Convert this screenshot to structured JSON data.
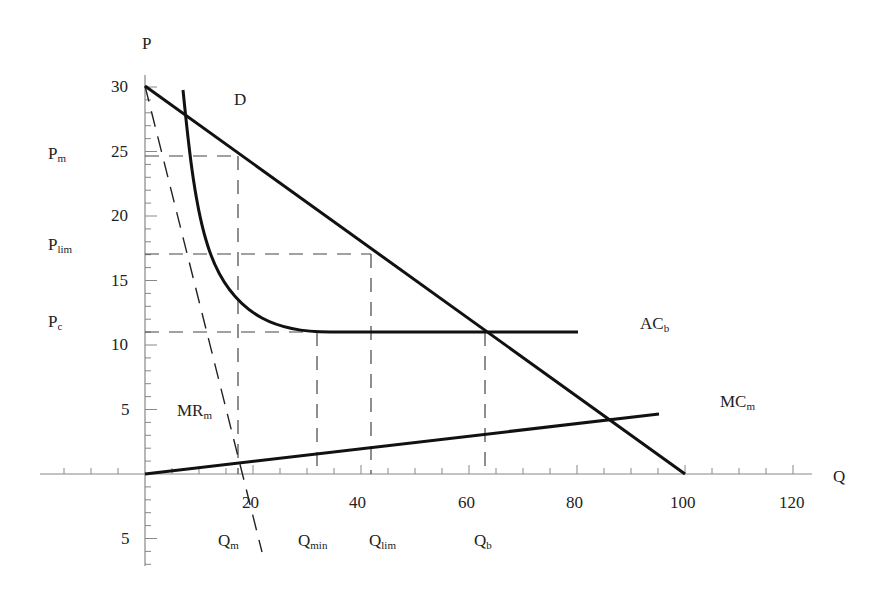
{
  "chart_data": {
    "type": "line",
    "title": "",
    "xlabel": "Q",
    "ylabel": "P",
    "xlim": [
      -19,
      123
    ],
    "ylim": [
      -7,
      31
    ],
    "grid": false,
    "x_ticks": [
      {
        "value": 20,
        "label": "20"
      },
      {
        "value": 40,
        "label": "40"
      },
      {
        "value": 60,
        "label": "60"
      },
      {
        "value": 80,
        "label": "80"
      },
      {
        "value": 100,
        "label": "100"
      },
      {
        "value": 120,
        "label": "120"
      }
    ],
    "y_ticks": [
      {
        "value": 30,
        "label": "30"
      },
      {
        "value": 25,
        "label": "25"
      },
      {
        "value": 20,
        "label": "20"
      },
      {
        "value": 15,
        "label": "15"
      },
      {
        "value": 10,
        "label": "10"
      },
      {
        "value": 5,
        "label": "5"
      },
      {
        "value": -5,
        "label": "5"
      }
    ],
    "series": [
      {
        "name": "D",
        "style": "solid",
        "points": [
          [
            0,
            30
          ],
          [
            100,
            0
          ]
        ]
      },
      {
        "name": "MR_m",
        "style": "dashed",
        "points": [
          [
            0,
            30
          ],
          [
            21.7,
            -6
          ]
        ]
      },
      {
        "name": "AC_b",
        "style": "solid",
        "points": [
          [
            7.0,
            29.7
          ],
          [
            8.0,
            27.5
          ],
          [
            9.0,
            24.6
          ],
          [
            10.1,
            20.0
          ],
          [
            12.8,
            17.0
          ],
          [
            14.9,
            15.2
          ],
          [
            17.2,
            13.3
          ],
          [
            21.3,
            11.9
          ],
          [
            26.9,
            11.1
          ],
          [
            34.3,
            10.9
          ],
          [
            80.0,
            10.9
          ]
        ]
      },
      {
        "name": "MC_m",
        "style": "solid",
        "points": [
          [
            0,
            0
          ],
          [
            95,
            4.65
          ]
        ]
      }
    ],
    "reference_lines": [
      {
        "name": "P_m",
        "axis": "y",
        "value": 24.6,
        "from": 0,
        "to": 17.2
      },
      {
        "name": "P_lim",
        "axis": "y",
        "value": 17.0,
        "from": 0,
        "to": 41.9
      },
      {
        "name": "P_c",
        "axis": "y",
        "value": 11.0,
        "from": 0,
        "to": 63.0
      },
      {
        "name": "Q_m",
        "axis": "x",
        "value": 17.2,
        "from": 0,
        "to": 24.6
      },
      {
        "name": "Q_min",
        "axis": "x",
        "value": 31.9,
        "from": 0,
        "to": 11.0
      },
      {
        "name": "Q_lim",
        "axis": "x",
        "value": 41.9,
        "from": 0,
        "to": 17.0
      },
      {
        "name": "Q_b",
        "axis": "x",
        "value": 63.0,
        "from": 0,
        "to": 11.0
      }
    ],
    "annotations": [
      {
        "text": "D",
        "x": 21,
        "y": 27.5
      },
      {
        "text": "AC_b",
        "x": 92,
        "y": 11
      },
      {
        "text": "MC_m",
        "x": 106,
        "y": 5
      },
      {
        "text": "MR_m",
        "x": 6,
        "y": 4.5
      },
      {
        "text": "P_m",
        "x": -19,
        "y": 24.6
      },
      {
        "text": "P_lim",
        "x": -19,
        "y": 17.0
      },
      {
        "text": "P_c",
        "x": -19,
        "y": 11.0
      },
      {
        "text": "Q_m",
        "x": 17.2,
        "y": -5
      },
      {
        "text": "Q_min",
        "x": 31.9,
        "y": -5
      },
      {
        "text": "Q_lim",
        "x": 41.9,
        "y": -5
      },
      {
        "text": "Q_b",
        "x": 63.0,
        "y": -5
      }
    ]
  },
  "labels": {
    "axis_p": "P",
    "axis_q": "Q",
    "demand": "D",
    "ac_main": "AC",
    "ac_sub": "b",
    "mc_main": "MC",
    "mc_sub": "m",
    "mr_main": "MR",
    "mr_sub": "m",
    "pm_main": "P",
    "pm_sub": "m",
    "plim_main": "P",
    "plim_sub": "lim",
    "pc_main": "P",
    "pc_sub": "c",
    "qm_main": "Q",
    "qm_sub": "m",
    "qmin_main": "Q",
    "qmin_sub": "min",
    "qlim_main": "Q",
    "qlim_sub": "lim",
    "qb_main": "Q",
    "qb_sub": "b"
  },
  "ticks": {
    "y30": "30",
    "y25": "25",
    "y20": "20",
    "y15": "15",
    "y10": "10",
    "y5": "5",
    "yneg5": "5",
    "x20": "20",
    "x40": "40",
    "x60": "60",
    "x80": "80",
    "x100": "100",
    "x120": "120"
  }
}
